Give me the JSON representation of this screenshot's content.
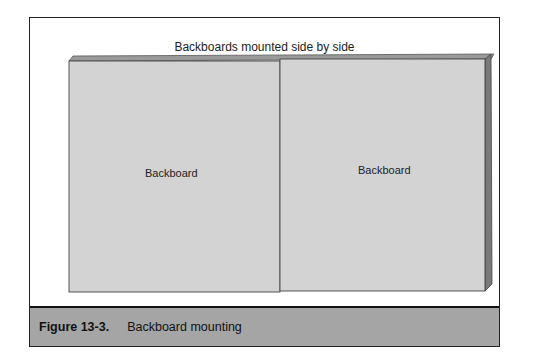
{
  "figure": {
    "title": "Backboards mounted side by side",
    "boards": [
      {
        "label": "Backboard"
      },
      {
        "label": "Backboard"
      }
    ],
    "caption": {
      "number": "Figure 13-3.",
      "text": "Backboard mounting"
    },
    "colors": {
      "board_face": "#d3d3d3",
      "board_top": "#9a9a9a",
      "board_side": "#7a7a7a",
      "caption_bar": "#a5a5a5"
    }
  }
}
